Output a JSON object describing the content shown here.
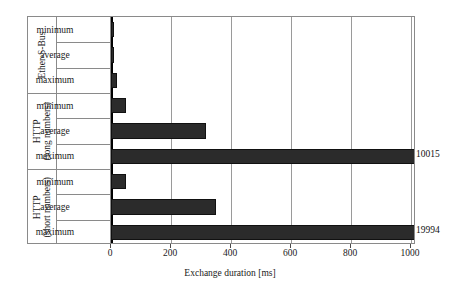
{
  "chart_data": {
    "type": "bar",
    "orientation": "horizontal",
    "title": "",
    "xlabel": "Exchange duration [ms]",
    "ylabel": "",
    "xlim": [
      0,
      1000
    ],
    "xticks": [
      0,
      200,
      400,
      600,
      800,
      1000
    ],
    "xtick_labels": [
      "0",
      "200",
      "400",
      "600",
      "800",
      "1000"
    ],
    "grid": true,
    "legend": "none",
    "bar_color": "#2b2b2b",
    "groups": [
      {
        "name": "Ether-S-Bus",
        "name_lines": [
          "Ether-S-Bus"
        ],
        "categories": [
          "minimum",
          "average",
          "maximum"
        ],
        "values": [
          5,
          8,
          20
        ],
        "labels": [
          "",
          "",
          ""
        ]
      },
      {
        "name": "HTTP (long numbers)",
        "name_lines": [
          "HTTP",
          "(long numbers)"
        ],
        "categories": [
          "minimum",
          "average",
          "maximum"
        ],
        "values": [
          50,
          317,
          10015
        ],
        "labels": [
          "",
          "",
          "10015"
        ]
      },
      {
        "name": "HTTP (short numbers)",
        "name_lines": [
          "HTTP",
          "(short numbers)"
        ],
        "categories": [
          "minimum",
          "average",
          "maximum"
        ],
        "values": [
          50,
          350,
          19994
        ],
        "labels": [
          "",
          "",
          "19994"
        ]
      }
    ],
    "overflow_labels": [
      {
        "value": "10015",
        "series": "HTTP (long numbers) maximum"
      },
      {
        "value": "19994",
        "series": "HTTP (short numbers) maximum"
      }
    ]
  }
}
